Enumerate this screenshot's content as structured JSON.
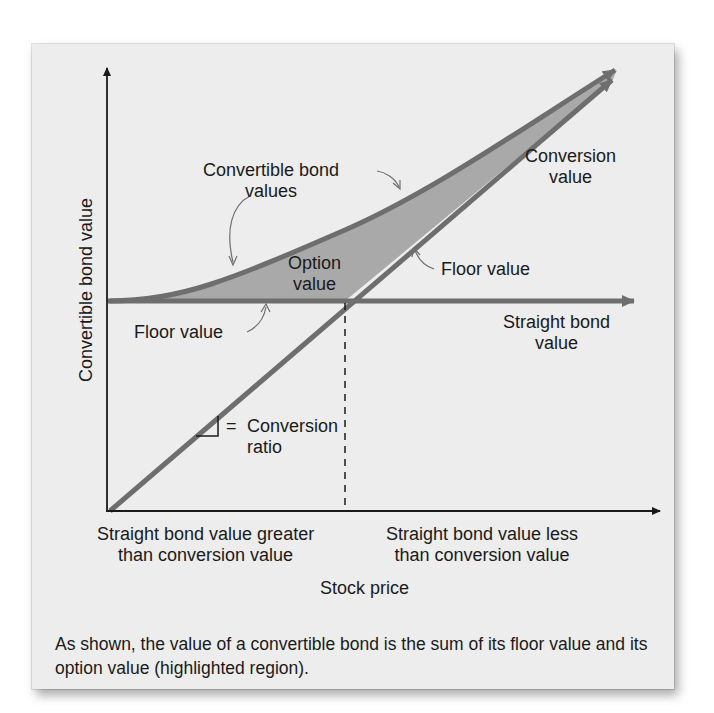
{
  "diagram": {
    "axes": {
      "y_label": "Convertible bond value",
      "x_label": "Stock price"
    },
    "curves": {
      "convertible_bond_values": "Convertible bond values",
      "conversion_value": "Conversion value",
      "straight_bond_value": "Straight bond value"
    },
    "annotations": {
      "convertible_label_line1": "Convertible bond",
      "convertible_label_line2": "values",
      "option_value_line1": "Option",
      "option_value_line2": "value",
      "floor_value_left": "Floor value",
      "floor_value_right": "Floor value",
      "conversion_value_line1": "Conversion",
      "conversion_value_line2": "value",
      "straight_bond_line1": "Straight bond",
      "straight_bond_line2": "value",
      "conversion_ratio_eq": "=",
      "conversion_ratio_line1": "Conversion",
      "conversion_ratio_line2": "ratio"
    },
    "regions": {
      "left_line1": "Straight bond value greater",
      "left_line2": "than conversion value",
      "right_line1": "Straight bond value less",
      "right_line2": "than conversion value"
    },
    "caption": "As shown, the value of a convertible bond is the sum of its floor value and its option value (highlighted region).",
    "colors": {
      "card_background": "#ededed",
      "line_gray": "#6e6e6e",
      "fill_gray": "#a9a9a9",
      "axis_black": "#1a1a1a"
    }
  }
}
